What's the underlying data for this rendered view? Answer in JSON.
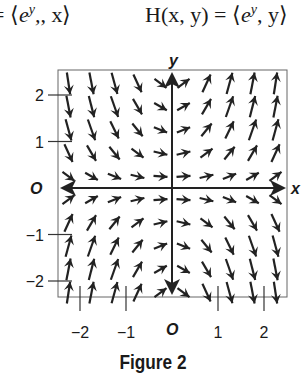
{
  "header": {
    "left_equation": "= ⟨e^y, x⟩",
    "left_equation_parts": {
      "prefix": "= ⟨",
      "base": "e",
      "sup": "y",
      "suffix": ", x⟩"
    },
    "right_equation": "H(x, y) = ⟨e^y, y⟩",
    "right_equation_parts": {
      "prefix": "H(x, y) = ⟨",
      "base": "e",
      "sup": "y",
      "suffix": ", y⟩"
    }
  },
  "plot": {
    "x_axis_label": "x",
    "y_axis_label": "y",
    "origin_label_x": "O",
    "origin_label_y": "O",
    "x_ticks": [
      {
        "value": -2,
        "label": "−2"
      },
      {
        "value": -1,
        "label": "−1"
      },
      {
        "value": 1,
        "label": "1"
      },
      {
        "value": 2,
        "label": "2"
      }
    ],
    "y_ticks": [
      {
        "value": 2,
        "label": "2"
      },
      {
        "value": 1,
        "label": "1"
      },
      {
        "value": -1,
        "label": "−1"
      },
      {
        "value": -2,
        "label": "−2"
      }
    ],
    "xlim": [
      -2.5,
      2.5
    ],
    "ylim": [
      -2.5,
      2.5
    ],
    "arrow_grid": {
      "x": [
        -2.25,
        -1.75,
        -1.25,
        -0.75,
        -0.25,
        0.25,
        0.75,
        1.25,
        1.75,
        2.25
      ],
      "y": [
        2.25,
        1.75,
        1.25,
        0.75,
        0.25,
        -0.25,
        -0.75,
        -1.25,
        -1.75,
        -2.25
      ]
    },
    "arrow_color": "#222222",
    "frame_color": "#555555"
  },
  "caption": "Figure 2"
}
